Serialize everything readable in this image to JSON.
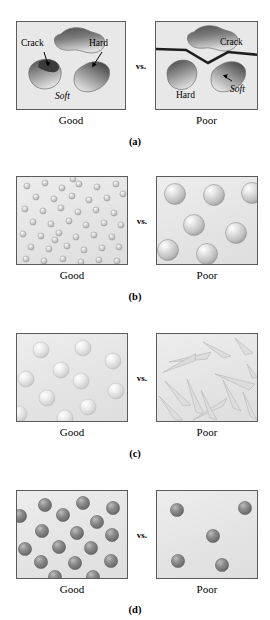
{
  "figure": {
    "vs_label": "vs.",
    "good_label": "Good",
    "poor_label": "Poor",
    "background_color": "#ffffff",
    "box_fill_color": "#e8e8e8",
    "box_border_color": "#5b5b5b"
  },
  "panels": [
    {
      "letter": "(a)",
      "topic": "crack-propagation-phases",
      "good": {
        "caption": "Good",
        "annotations": [
          {
            "text": "Crack",
            "x": 5,
            "y": 22
          },
          {
            "text": "Hard",
            "x": 72,
            "y": 22
          },
          {
            "text": "Soft",
            "x": 38,
            "y": 70
          }
        ],
        "particle_color_dark": "#5a5a5a",
        "particle_color_light": "#d8d8d8",
        "crack_color": "#2b2b2b",
        "crack_contained": "true"
      },
      "poor": {
        "caption": "Poor",
        "annotations": [
          {
            "text": "Crack",
            "x": 64,
            "y": 20
          },
          {
            "text": "Hard",
            "x": 22,
            "y": 70
          },
          {
            "text": "Soft",
            "x": 68,
            "y": 66
          }
        ],
        "particle_color_dark": "#5a5a5a",
        "particle_color_light": "#d8d8d8",
        "crack_color": "#1f1f1f",
        "crack_contained": "false"
      }
    },
    {
      "letter": "(b)",
      "topic": "particle-size-distribution",
      "good": {
        "caption": "Good",
        "particle_count": 44,
        "particle_size_px": 6,
        "particle_color": "#c9c9c9"
      },
      "poor": {
        "caption": "Poor",
        "particle_count": 7,
        "particle_size_px": 20,
        "particle_color": "#cfcfcf"
      }
    },
    {
      "letter": "(c)",
      "topic": "particle-shape",
      "good": {
        "caption": "Good",
        "particle_count": 11,
        "particle_shape": "sphere",
        "particle_size_px": 15,
        "particle_color": "#dcdcdc"
      },
      "poor": {
        "caption": "Poor",
        "particle_count": 13,
        "particle_shape": "angular-sliver",
        "particle_color": "#d5d5d5"
      }
    },
    {
      "letter": "(d)",
      "topic": "particle-volume-fraction",
      "good": {
        "caption": "Good",
        "particle_count": 17,
        "particle_size_px": 13,
        "particle_color": "#7d7d7d"
      },
      "poor": {
        "caption": "Poor",
        "particle_count": 5,
        "particle_size_px": 13,
        "particle_color": "#7d7d7d"
      }
    }
  ]
}
